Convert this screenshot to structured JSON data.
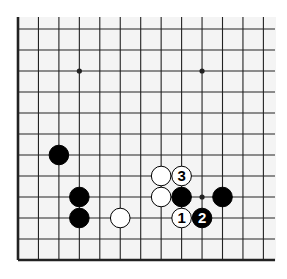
{
  "diagram": {
    "type": "go-board-fragment",
    "edges_shown": [
      "left",
      "bottom"
    ],
    "columns": 13,
    "rows": 12,
    "colors": {
      "background": "#ffffff",
      "board": "#f4f4f4",
      "line": "#222222",
      "black_stone": "#000000",
      "white_stone": "#ffffff"
    },
    "star_points": [
      {
        "col": 3,
        "row": 2
      },
      {
        "col": 9,
        "row": 2
      },
      {
        "col": 9,
        "row": 8
      }
    ],
    "stones": [
      {
        "color": "black",
        "col": 2,
        "row": 6,
        "label": ""
      },
      {
        "color": "black",
        "col": 3,
        "row": 8,
        "label": ""
      },
      {
        "color": "black",
        "col": 3,
        "row": 9,
        "label": ""
      },
      {
        "color": "white",
        "col": 5,
        "row": 9,
        "label": ""
      },
      {
        "color": "white",
        "col": 7,
        "row": 7,
        "label": ""
      },
      {
        "color": "white",
        "col": 8,
        "row": 7,
        "label": "3"
      },
      {
        "color": "white",
        "col": 7,
        "row": 8,
        "label": ""
      },
      {
        "color": "black",
        "col": 8,
        "row": 8,
        "label": ""
      },
      {
        "color": "black",
        "col": 10,
        "row": 8,
        "label": ""
      },
      {
        "color": "white",
        "col": 8,
        "row": 9,
        "label": "1"
      },
      {
        "color": "black",
        "col": 9,
        "row": 9,
        "label": "2"
      }
    ]
  }
}
